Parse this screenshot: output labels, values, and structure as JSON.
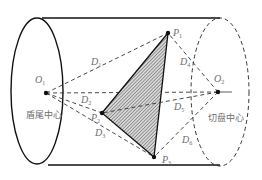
{
  "diagram": {
    "type": "shield-tunnel-geometry",
    "colors": {
      "stroke": "#111111",
      "dash": "#333333",
      "label": "#6e6e6e",
      "hatch": "#555555",
      "background": "#ffffff"
    },
    "centers": {
      "O1": {
        "label": "O",
        "sub": "1",
        "x": 46,
        "y": 93
      },
      "O2": {
        "label": "O",
        "sub": "2",
        "x": 218,
        "y": 92
      }
    },
    "center_names": {
      "shield_tail": "盾尾中心",
      "cutter_head": "切盘中心"
    },
    "points": [
      {
        "id": "P1",
        "label": "P",
        "sub": "1",
        "x": 168,
        "y": 33
      },
      {
        "id": "P2",
        "label": "P",
        "sub": "2",
        "x": 102,
        "y": 113
      },
      {
        "id": "P3",
        "label": "P",
        "sub": "3",
        "x": 154,
        "y": 157
      }
    ],
    "distances": [
      {
        "label": "D",
        "sub": "1",
        "from": "O1",
        "to": "P1"
      },
      {
        "label": "D",
        "sub": "2",
        "from": "O1",
        "to": "P2"
      },
      {
        "label": "D",
        "sub": "3",
        "from": "O1",
        "to": "P3"
      },
      {
        "label": "D",
        "sub": "4",
        "from": "O2",
        "to": "P1"
      },
      {
        "label": "D",
        "sub": "5",
        "from": "O2",
        "to": "P2"
      },
      {
        "label": "D",
        "sub": "6",
        "from": "O2",
        "to": "P3"
      }
    ]
  }
}
